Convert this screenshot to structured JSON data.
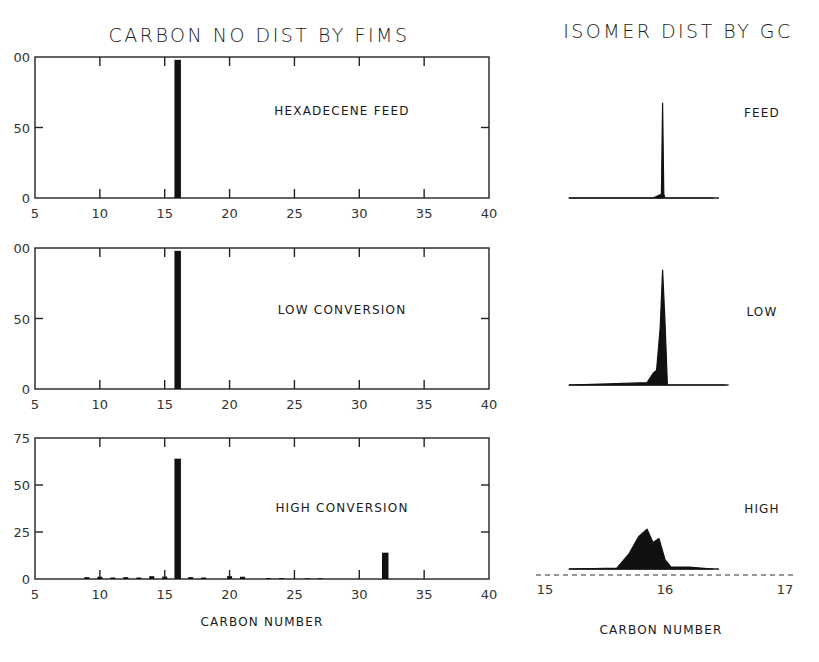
{
  "left": {
    "title": "CARBON NO DIST BY FIMS",
    "xlabel": "CARBON NUMBER",
    "panels": [
      {
        "label": "HEXADECENE FEED",
        "y_ticks": [
          "0",
          "50",
          "00"
        ],
        "ymax": 100
      },
      {
        "label": "LOW CONVERSION",
        "y_ticks": [
          "0",
          "50",
          "00"
        ],
        "ymax": 100
      },
      {
        "label": "HIGH CONVERSION",
        "y_ticks": [
          "0",
          "25",
          "50",
          "75"
        ],
        "ymax": 75
      }
    ],
    "x_ticks": [
      "5",
      "10",
      "15",
      "20",
      "25",
      "30",
      "35",
      "40"
    ]
  },
  "right": {
    "title": "ISOMER DIST BY GC",
    "xlabel": "CARBON NUMBER",
    "panel_labels": [
      "FEED",
      "LOW",
      "HIGH"
    ],
    "x_ticks": [
      "15",
      "16",
      "17"
    ]
  },
  "chart_data": [
    {
      "type": "bar",
      "title": "CARBON NO DIST BY FIMS — HEXADECENE FEED",
      "xlabel": "CARBON NUMBER",
      "ylabel": "",
      "xlim": [
        5,
        40
      ],
      "ylim": [
        0,
        100
      ],
      "x_ticks": [
        5,
        10,
        15,
        20,
        25,
        30,
        35,
        40
      ],
      "y_ticks": [
        0,
        50,
        100
      ],
      "x": [
        16
      ],
      "values": [
        98
      ]
    },
    {
      "type": "bar",
      "title": "CARBON NO DIST BY FIMS — LOW CONVERSION",
      "xlabel": "CARBON NUMBER",
      "ylabel": "",
      "xlim": [
        5,
        40
      ],
      "ylim": [
        0,
        100
      ],
      "x_ticks": [
        5,
        10,
        15,
        20,
        25,
        30,
        35,
        40
      ],
      "y_ticks": [
        0,
        50,
        100
      ],
      "x": [
        16
      ],
      "values": [
        98
      ]
    },
    {
      "type": "bar",
      "title": "CARBON NO DIST BY FIMS — HIGH CONVERSION",
      "xlabel": "CARBON NUMBER",
      "ylabel": "",
      "xlim": [
        5,
        40
      ],
      "ylim": [
        0,
        75
      ],
      "x_ticks": [
        5,
        10,
        15,
        20,
        25,
        30,
        35,
        40
      ],
      "y_ticks": [
        0,
        25,
        50,
        75
      ],
      "x": [
        9,
        10,
        11,
        12,
        13,
        14,
        15,
        16,
        17,
        18,
        20,
        21,
        23,
        24,
        26,
        27,
        32
      ],
      "values": [
        1.0,
        1.2,
        0.8,
        1.0,
        0.8,
        1.5,
        1.3,
        64,
        1.0,
        0.8,
        1.5,
        1.2,
        0.5,
        0.5,
        0.4,
        0.4,
        14
      ]
    },
    {
      "type": "line",
      "title": "ISOMER DIST BY GC",
      "xlabel": "CARBON NUMBER",
      "xlim": [
        15,
        17
      ],
      "x_ticks": [
        15,
        16,
        17
      ],
      "series": [
        {
          "name": "FEED",
          "description": "single sharp peak just below C16 (~15.98) with tiny shoulder",
          "x": [
            15.2,
            15.9,
            15.95,
            15.97,
            15.98,
            15.99,
            16.0,
            16.4
          ],
          "values": [
            0,
            0,
            3,
            4,
            100,
            4,
            0,
            0
          ]
        },
        {
          "name": "LOW",
          "description": "dominant peak at ~15.98 with small shoulder cluster at ~15.92 and secondary at ~16.0",
          "x": [
            15.2,
            15.85,
            15.9,
            15.93,
            15.96,
            15.98,
            16.0,
            16.02,
            16.5
          ],
          "values": [
            0,
            2,
            10,
            13,
            50,
            100,
            55,
            0,
            0
          ]
        },
        {
          "name": "HIGH",
          "description": "broad isomerized hump centered ~15.85 spanning ~15.65–16.05, max ~20% of feed peak",
          "x": [
            15.2,
            15.6,
            15.7,
            15.78,
            15.85,
            15.9,
            15.95,
            16.0,
            16.05,
            16.2,
            16.4
          ],
          "values": [
            0,
            0.5,
            8,
            17,
            21,
            14,
            16,
            5,
            1,
            1,
            0
          ]
        }
      ]
    }
  ]
}
